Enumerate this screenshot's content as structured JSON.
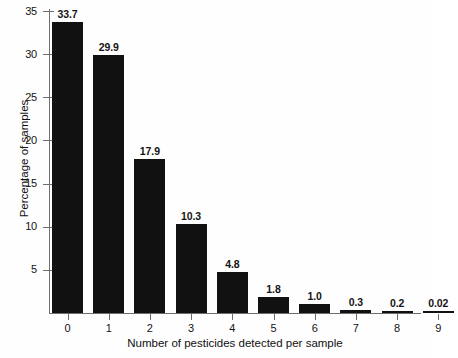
{
  "chart_data": {
    "type": "bar",
    "title": "",
    "xlabel": "Number of pesticides detected per sample",
    "ylabel": "Percentage of samples",
    "categories": [
      "0",
      "1",
      "2",
      "3",
      "4",
      "5",
      "6",
      "7",
      "8",
      "9"
    ],
    "values": [
      33.7,
      29.9,
      17.9,
      10.3,
      4.8,
      1.8,
      1.0,
      0.3,
      0.2,
      0.02
    ],
    "data_labels": [
      "33.7",
      "29.9",
      "17.9",
      "10.3",
      "4.8",
      "1.8",
      "1.0",
      "0.3",
      "0.2",
      "0.02"
    ],
    "yticks": [
      5,
      10,
      15,
      20,
      25,
      30,
      35
    ],
    "ytick_labels": [
      "5",
      "10",
      "15",
      "20",
      "25",
      "30",
      "35"
    ],
    "ylim": [
      0,
      36
    ],
    "grid": false,
    "legend": false,
    "bar_color": "#111111",
    "axis_color": "#6d6d6d",
    "background_color": "#fefefe"
  }
}
